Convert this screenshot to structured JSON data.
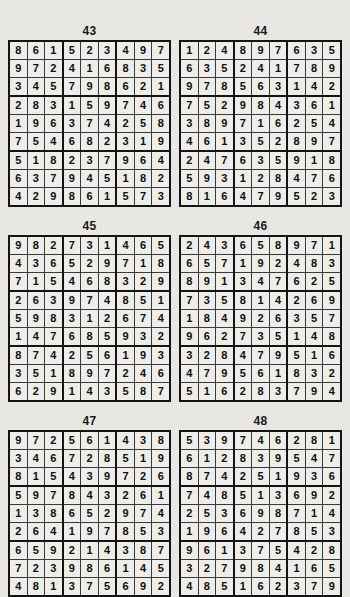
{
  "page": {
    "kind": "sudoku-solutions-page",
    "background_color": "#e9e8e4",
    "grid_line_color": "#3a3a3a",
    "grid_border_color": "#141414",
    "cell_text_color": "#101010",
    "columns": 2,
    "rows": 3
  },
  "puzzles": [
    {
      "title": "43",
      "grid": [
        [
          8,
          6,
          1,
          5,
          2,
          3,
          4,
          9,
          7
        ],
        [
          9,
          7,
          2,
          4,
          1,
          6,
          8,
          3,
          5
        ],
        [
          3,
          4,
          5,
          7,
          9,
          8,
          6,
          2,
          1
        ],
        [
          2,
          8,
          3,
          1,
          5,
          9,
          7,
          4,
          6
        ],
        [
          1,
          9,
          6,
          3,
          7,
          4,
          2,
          5,
          8
        ],
        [
          7,
          5,
          4,
          6,
          8,
          2,
          3,
          1,
          9
        ],
        [
          5,
          1,
          8,
          2,
          3,
          7,
          9,
          6,
          4
        ],
        [
          6,
          3,
          7,
          9,
          4,
          5,
          1,
          8,
          2
        ],
        [
          4,
          2,
          9,
          8,
          6,
          1,
          5,
          7,
          3
        ]
      ]
    },
    {
      "title": "44",
      "grid": [
        [
          1,
          2,
          4,
          8,
          9,
          7,
          6,
          3,
          5
        ],
        [
          6,
          3,
          5,
          2,
          4,
          1,
          7,
          8,
          9
        ],
        [
          9,
          7,
          8,
          5,
          6,
          3,
          1,
          4,
          2
        ],
        [
          7,
          5,
          2,
          9,
          8,
          4,
          3,
          6,
          1
        ],
        [
          3,
          8,
          9,
          7,
          1,
          6,
          2,
          5,
          4
        ],
        [
          4,
          6,
          1,
          3,
          5,
          2,
          8,
          9,
          7
        ],
        [
          2,
          4,
          7,
          6,
          3,
          5,
          9,
          1,
          8
        ],
        [
          5,
          9,
          3,
          1,
          2,
          8,
          4,
          7,
          6
        ],
        [
          8,
          1,
          6,
          4,
          7,
          9,
          5,
          2,
          3
        ]
      ]
    },
    {
      "title": "45",
      "grid": [
        [
          9,
          8,
          2,
          7,
          3,
          1,
          4,
          6,
          5
        ],
        [
          4,
          3,
          6,
          5,
          2,
          9,
          7,
          1,
          8
        ],
        [
          7,
          1,
          5,
          4,
          6,
          8,
          3,
          2,
          9
        ],
        [
          2,
          6,
          3,
          9,
          7,
          4,
          8,
          5,
          1
        ],
        [
          5,
          9,
          8,
          3,
          1,
          2,
          6,
          7,
          4
        ],
        [
          1,
          4,
          7,
          6,
          8,
          5,
          9,
          3,
          2
        ],
        [
          8,
          7,
          4,
          2,
          5,
          6,
          1,
          9,
          3
        ],
        [
          3,
          5,
          1,
          8,
          9,
          7,
          2,
          4,
          6
        ],
        [
          6,
          2,
          9,
          1,
          4,
          3,
          5,
          8,
          7
        ]
      ]
    },
    {
      "title": "46",
      "grid": [
        [
          2,
          4,
          3,
          6,
          5,
          8,
          9,
          7,
          1
        ],
        [
          6,
          5,
          7,
          1,
          9,
          2,
          4,
          8,
          3
        ],
        [
          8,
          9,
          1,
          3,
          4,
          7,
          6,
          2,
          5
        ],
        [
          7,
          3,
          5,
          8,
          1,
          4,
          2,
          6,
          9
        ],
        [
          1,
          8,
          4,
          9,
          2,
          6,
          3,
          5,
          7
        ],
        [
          9,
          6,
          2,
          7,
          3,
          5,
          1,
          4,
          8
        ],
        [
          3,
          2,
          8,
          4,
          7,
          9,
          5,
          1,
          6
        ],
        [
          4,
          7,
          9,
          5,
          6,
          1,
          8,
          3,
          2
        ],
        [
          5,
          1,
          6,
          2,
          8,
          3,
          7,
          9,
          4
        ]
      ]
    },
    {
      "title": "47",
      "grid": [
        [
          9,
          7,
          2,
          5,
          6,
          1,
          4,
          3,
          8
        ],
        [
          3,
          4,
          6,
          7,
          2,
          8,
          5,
          1,
          9
        ],
        [
          8,
          1,
          5,
          4,
          3,
          9,
          7,
          2,
          6
        ],
        [
          5,
          9,
          7,
          8,
          4,
          3,
          2,
          6,
          1
        ],
        [
          1,
          3,
          8,
          6,
          5,
          2,
          9,
          7,
          4
        ],
        [
          2,
          6,
          4,
          1,
          9,
          7,
          8,
          5,
          3
        ],
        [
          6,
          5,
          9,
          2,
          1,
          4,
          3,
          8,
          7
        ],
        [
          7,
          2,
          3,
          9,
          8,
          6,
          1,
          4,
          5
        ],
        [
          4,
          8,
          1,
          3,
          7,
          5,
          6,
          9,
          2
        ]
      ]
    },
    {
      "title": "48",
      "grid": [
        [
          5,
          3,
          9,
          7,
          4,
          6,
          2,
          8,
          1
        ],
        [
          6,
          1,
          2,
          8,
          3,
          9,
          5,
          4,
          7
        ],
        [
          8,
          7,
          4,
          2,
          5,
          1,
          9,
          3,
          6
        ],
        [
          7,
          4,
          8,
          5,
          1,
          3,
          6,
          9,
          2
        ],
        [
          2,
          5,
          3,
          6,
          9,
          8,
          7,
          1,
          4
        ],
        [
          1,
          9,
          6,
          4,
          2,
          7,
          8,
          5,
          3
        ],
        [
          9,
          6,
          1,
          3,
          7,
          5,
          4,
          2,
          8
        ],
        [
          3,
          2,
          7,
          9,
          8,
          4,
          1,
          6,
          5
        ],
        [
          4,
          8,
          5,
          1,
          6,
          2,
          3,
          7,
          9
        ]
      ]
    }
  ]
}
